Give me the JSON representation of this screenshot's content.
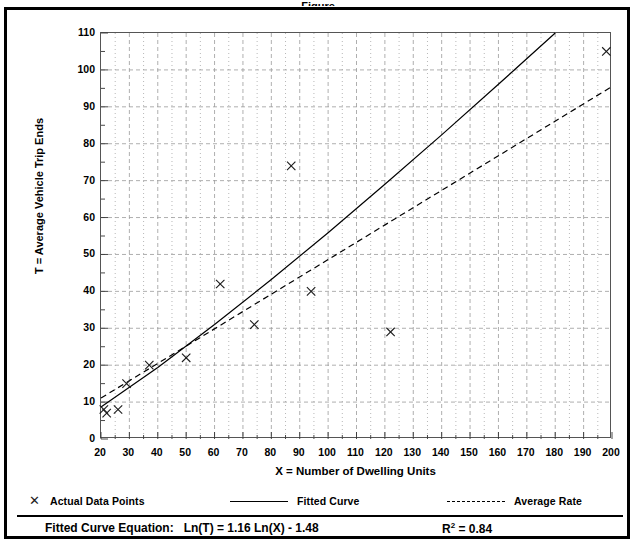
{
  "title_sliver": "Figure",
  "chart_data": {
    "type": "scatter",
    "title": "",
    "xlabel": "X = Number of Dwelling Units",
    "ylabel": "T = Average Vehicle Trip Ends",
    "xlim": [
      20,
      200
    ],
    "ylim": [
      0,
      110
    ],
    "grid": true,
    "x_major_step": 10,
    "y_major_step": 10,
    "x_minor_step": 5,
    "y_minor_step": 5,
    "x_ticks": [
      20,
      30,
      40,
      50,
      60,
      70,
      80,
      90,
      100,
      110,
      120,
      130,
      140,
      150,
      160,
      170,
      180,
      190,
      200
    ],
    "y_ticks": [
      0,
      10,
      20,
      30,
      40,
      50,
      60,
      70,
      80,
      90,
      100,
      110
    ],
    "legend_position": "below-plot",
    "series": [
      {
        "name": "Actual Data Points",
        "type": "scatter",
        "marker": "x",
        "points": [
          {
            "x": 21,
            "y": 8
          },
          {
            "x": 22,
            "y": 7
          },
          {
            "x": 26,
            "y": 8
          },
          {
            "x": 29,
            "y": 15
          },
          {
            "x": 37,
            "y": 20
          },
          {
            "x": 50,
            "y": 22
          },
          {
            "x": 62,
            "y": 42
          },
          {
            "x": 74,
            "y": 31
          },
          {
            "x": 87,
            "y": 74
          },
          {
            "x": 94,
            "y": 40
          },
          {
            "x": 122,
            "y": 29
          },
          {
            "x": 198,
            "y": 105
          }
        ]
      },
      {
        "name": "Fitted Curve",
        "type": "line",
        "style": "solid",
        "equation": "Ln(T) = 1.16 Ln(X) - 1.48",
        "points": [
          {
            "x": 20,
            "y": 8.7
          },
          {
            "x": 40,
            "y": 19.4
          },
          {
            "x": 60,
            "y": 31.0
          },
          {
            "x": 80,
            "y": 43.2
          },
          {
            "x": 100,
            "y": 55.9
          },
          {
            "x": 120,
            "y": 69.0
          },
          {
            "x": 140,
            "y": 82.4
          },
          {
            "x": 160,
            "y": 96.1
          },
          {
            "x": 180,
            "y": 110.0
          }
        ]
      },
      {
        "name": "Average Rate",
        "type": "line",
        "style": "dashed",
        "points": [
          {
            "x": 20,
            "y": 11.1
          },
          {
            "x": 200,
            "y": 95.5
          }
        ]
      }
    ]
  },
  "legend": [
    {
      "label": "Actual Data Points",
      "marker": "x-marker-icon"
    },
    {
      "label": "Fitted Curve",
      "marker": "solid-line-icon"
    },
    {
      "label": "Average Rate",
      "marker": "dashed-line-icon"
    }
  ],
  "footer": {
    "equation_label": "Fitted Curve Equation:",
    "equation_value": "Ln(T) = 1.16 Ln(X) - 1.48",
    "r_squared_symbol": "R",
    "r_squared_exponent": "2",
    "r_squared_value": "= 0.84"
  },
  "colors": {
    "ink": "#000000",
    "grid": "#9a9a9a",
    "axis": "#555555",
    "background": "#ffffff"
  }
}
